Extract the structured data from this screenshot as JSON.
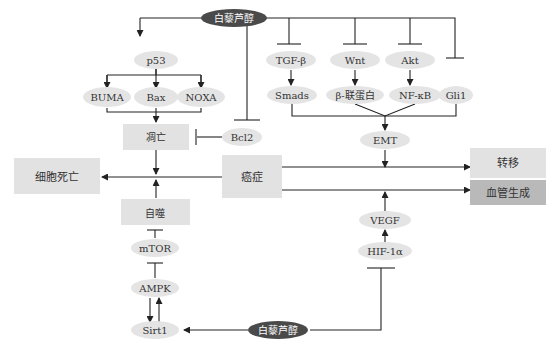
{
  "nodes": {
    "resveratrol_top": "白藜芦醇",
    "resveratrol_bottom": "白藜芦醇",
    "p53": "p53",
    "buma": "BUMA",
    "bax": "Bax",
    "noxa": "NOXA",
    "apoptosis": "凋亡",
    "bcl2": "Bcl2",
    "cell_death": "细胞死亡",
    "cancer": "癌症",
    "autophagy": "自噬",
    "mtor": "mTOR",
    "ampk": "AMPK",
    "sirt1": "Sirt1",
    "tgf_beta": "TGF-β",
    "wnt": "Wnt",
    "akt": "Akt",
    "smads": "Smads",
    "beta_catenin": "β-联蛋白",
    "nfkb": "NF-κB",
    "gli1": "Gli1",
    "emt": "EMT",
    "metastasis": "转移",
    "angiogenesis": "血管生成",
    "vegf": "VEGF",
    "hif1a": "HIF-1α"
  },
  "colors": {
    "ellipse": "#e4e4e4",
    "resveratrol": "#4a4a4a",
    "box": "#e2e2e2",
    "angiogenesis_box": "#b9b9b9",
    "line": "#222222"
  }
}
